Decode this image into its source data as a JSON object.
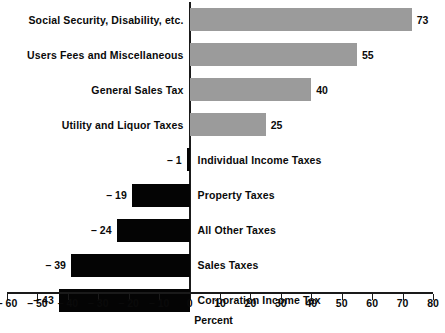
{
  "chart_data": {
    "type": "bar",
    "orientation": "horizontal",
    "title": "",
    "xlabel": "Percent",
    "ylabel": "",
    "xlim": [
      -60,
      80
    ],
    "xticks": [
      -60,
      -50,
      -40,
      -30,
      -20,
      -10,
      0,
      10,
      20,
      30,
      40,
      50,
      60,
      70,
      80
    ],
    "xticklabels": [
      "– 60",
      "– 50",
      "– 40",
      "– 30",
      "– 20",
      "– 10",
      "0",
      "10",
      "20",
      "30",
      "40",
      "50",
      "60",
      "70",
      "80"
    ],
    "grid": false,
    "legend": null,
    "categories": [
      "Social Security, Disability, etc.",
      "Users Fees and Miscellaneous",
      "General Sales Tax",
      "Utility and Liquor Taxes",
      "Individual Income Taxes",
      "Property Taxes",
      "All Other Taxes",
      "Sales Taxes",
      "Corporation Income Tax"
    ],
    "values": [
      73,
      55,
      40,
      25,
      -1,
      -19,
      -24,
      -39,
      -43
    ],
    "value_labels": [
      "73",
      "55",
      "40",
      "25",
      "– 1",
      "– 19",
      "– 24",
      "– 39",
      "– 43"
    ],
    "bars": [
      {
        "category": "Social Security, Disability, etc.",
        "value": 73,
        "value_label": "73",
        "color": "#9b9b9b",
        "sign": "positive"
      },
      {
        "category": "Users Fees and Miscellaneous",
        "value": 55,
        "value_label": "55",
        "color": "#9b9b9b",
        "sign": "positive"
      },
      {
        "category": "General Sales Tax",
        "value": 40,
        "value_label": "40",
        "color": "#9b9b9b",
        "sign": "positive"
      },
      {
        "category": "Utility and Liquor Taxes",
        "value": 25,
        "value_label": "25",
        "color": "#9b9b9b",
        "sign": "positive"
      },
      {
        "category": "Individual Income Taxes",
        "value": -1,
        "value_label": "– 1",
        "color": "#040404",
        "sign": "negative"
      },
      {
        "category": "Property Taxes",
        "value": -19,
        "value_label": "– 19",
        "color": "#040404",
        "sign": "negative"
      },
      {
        "category": "All Other Taxes",
        "value": -24,
        "value_label": "– 24",
        "color": "#040404",
        "sign": "negative"
      },
      {
        "category": "Sales Taxes",
        "value": -39,
        "value_label": "– 39",
        "color": "#040404",
        "sign": "negative"
      },
      {
        "category": "Corporation Income Tax",
        "value": -43,
        "value_label": "– 43",
        "color": "#040404",
        "sign": "negative"
      }
    ],
    "colors": {
      "positive_bar": "#9b9b9b",
      "negative_bar": "#040404",
      "axis": "#1a1a1a",
      "text": "#0a0a0a",
      "background": "#ffffff"
    }
  }
}
